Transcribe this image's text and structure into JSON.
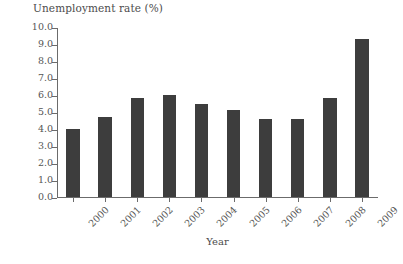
{
  "chart_data": {
    "type": "bar",
    "title": "",
    "ylabel": "Unemployment rate (%)",
    "xlabel": "Year",
    "categories": [
      "2000",
      "2001",
      "2002",
      "2003",
      "2004",
      "2005",
      "2006",
      "2007",
      "2008",
      "2009"
    ],
    "values": [
      4.0,
      4.7,
      5.8,
      6.0,
      5.5,
      5.1,
      4.6,
      4.6,
      5.8,
      9.3
    ],
    "series": [
      {
        "name": "Unemployment rate (%)",
        "values": [
          4.0,
          4.7,
          5.8,
          6.0,
          5.5,
          5.1,
          4.6,
          4.6,
          5.8,
          9.3
        ]
      }
    ],
    "ylim": [
      0.0,
      10.0
    ],
    "ytick_values": [
      0.0,
      1.0,
      2.0,
      3.0,
      4.0,
      5.0,
      6.0,
      7.0,
      8.0,
      9.0,
      10.0
    ],
    "ytick_labels": [
      "0.0",
      "1.0",
      "2.0",
      "3.0",
      "4.0",
      "5.0",
      "6.0",
      "7.0",
      "8.0",
      "9.0",
      "10.0"
    ],
    "xtick_labels": [
      "2000",
      "2001",
      "2002",
      "2003",
      "2004",
      "2005",
      "2006",
      "2007",
      "2008",
      "2009"
    ],
    "xtick_rotation_deg": -45,
    "grid": false,
    "legend": null,
    "legend_position": "none",
    "bar_color": "#3d3d3d",
    "axis_color": "#6b6b6b",
    "text_color": "#555555",
    "background_color": "#ffffff",
    "spines": [
      "left",
      "bottom"
    ]
  }
}
